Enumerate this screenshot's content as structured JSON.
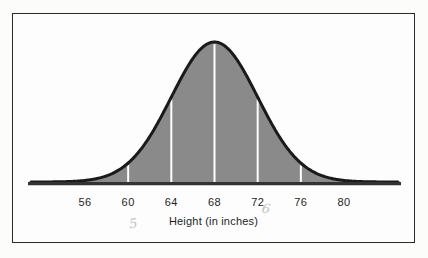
{
  "figure": {
    "background_color": "#fcfcfb",
    "panel_color": "#fdfdfd",
    "frame_color": "#2a2a2a"
  },
  "chart_data": {
    "type": "area",
    "title": "",
    "xlabel": "Height (in inches)",
    "ylabel": "",
    "grid": false,
    "legend": null,
    "distribution": "normal",
    "mean": 68,
    "std_dev": 4,
    "xlim": [
      51,
      85
    ],
    "ylim": [
      0,
      1
    ],
    "tick_values": [
      56,
      60,
      64,
      68,
      72,
      76,
      80
    ],
    "tick_labels": [
      "56",
      "60",
      "64",
      "68",
      "72",
      "76",
      "80"
    ],
    "x": [
      51,
      52,
      53,
      54,
      55,
      56,
      57,
      58,
      59,
      60,
      61,
      62,
      63,
      64,
      65,
      66,
      67,
      68,
      69,
      70,
      71,
      72,
      73,
      74,
      75,
      76,
      77,
      78,
      79,
      80,
      81,
      82,
      83,
      84,
      85
    ],
    "y": [
      0.012,
      0.019,
      0.029,
      0.044,
      0.063,
      0.088,
      0.121,
      0.162,
      0.211,
      0.268,
      0.333,
      0.404,
      0.478,
      0.552,
      0.625,
      0.691,
      0.75,
      0.797,
      0.831,
      0.85,
      0.853,
      0.841,
      0.814,
      0.774,
      0.723,
      0.663,
      0.598,
      0.53,
      0.462,
      0.396,
      0.334,
      0.277,
      0.227,
      0.183,
      0.146
    ],
    "curve_fill_color": "#8a8a8a",
    "curve_outline_color": "#1a1a1a",
    "curve_outline_width": 3,
    "baseline_color": "#333333",
    "tick_line_color": "#ffffff",
    "annotations": [
      {
        "text": "5",
        "near_tick": "60",
        "kind": "handwritten-pencil"
      },
      {
        "text": "6",
        "near_tick": "72",
        "kind": "handwritten-pencil"
      }
    ]
  }
}
